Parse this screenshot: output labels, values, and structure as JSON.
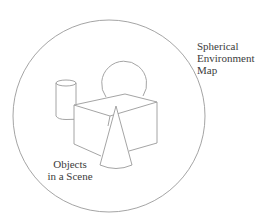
{
  "diagram": {
    "type": "illustration",
    "labels": {
      "environment_map": [
        "Spherical",
        "Environment",
        "Map"
      ],
      "objects": [
        "Objects",
        "in a Scene"
      ]
    },
    "shapes": {
      "environment_sphere": {
        "cx": 109,
        "cy": 116,
        "r": 96
      },
      "sphere": {
        "cx": 124.5,
        "cy": 82,
        "r": 22.5
      },
      "cylinder": {
        "x": 56,
        "top_y": 83,
        "width": 20,
        "bottom_y": 119
      },
      "box": {
        "top_face": [
          [
            74,
            105
          ],
          [
            125,
            94
          ],
          [
            157,
            102
          ],
          [
            110,
            116
          ]
        ],
        "bottom_y_sides": 144
      },
      "cone": {
        "apex": [
          116,
          106
        ],
        "base_left": [
          100,
          165
        ],
        "base_right": [
          132,
          165
        ]
      }
    },
    "colors": {
      "line": "#9a9a9a",
      "text": "#3c3c3c",
      "background": "#ffffff"
    }
  }
}
